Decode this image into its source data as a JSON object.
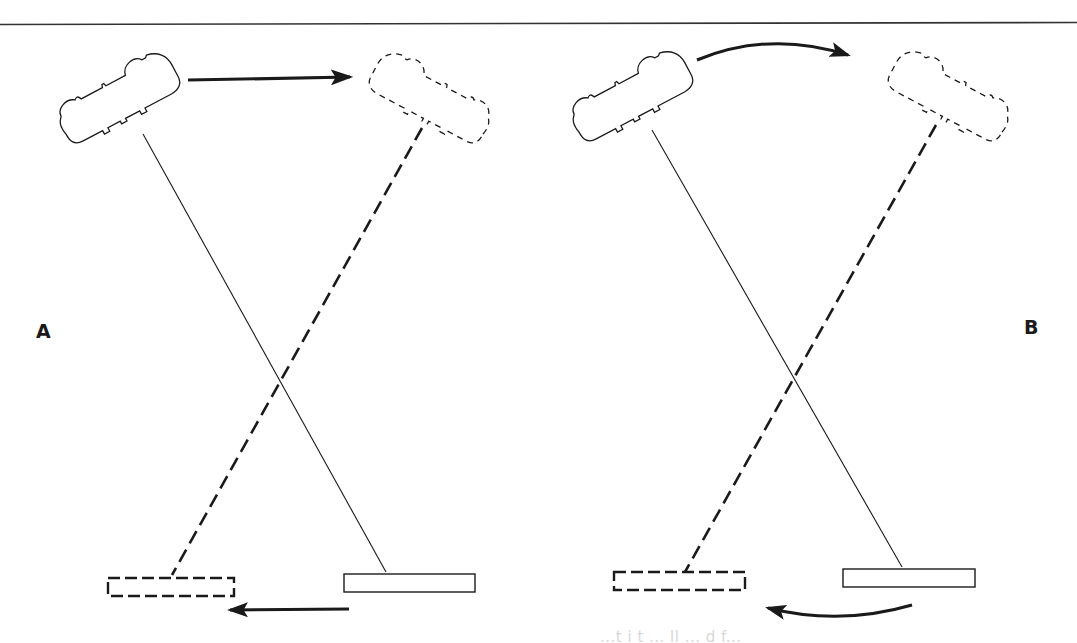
{
  "figure": {
    "panels": [
      {
        "label": "A",
        "description": "Camera slides (trucks) horizontally; subject moves opposite direction",
        "camera_motion": "straight arrow left-to-right",
        "subject_motion": "straight arrow right-to-left"
      },
      {
        "label": "B",
        "description": "Camera arcs around; subject moves along curved path in opposite direction",
        "camera_motion": "curved arrow left-to-right",
        "subject_motion": "curved arrow right-to-left"
      }
    ],
    "legend": {
      "solid_outline": "starting position",
      "dashed_outline": "ending position"
    },
    "caption_fragment": "...t i t ... ll ... d f..."
  },
  "colors": {
    "ink": "#1a1a1a",
    "background": "#ffffff",
    "ghost_text": "#d8d8d8"
  }
}
